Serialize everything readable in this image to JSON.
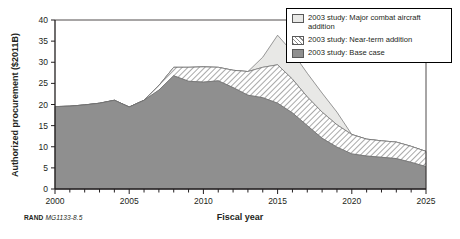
{
  "source_note": {
    "org": "RAND",
    "doc_id": "MG1133-8.5"
  },
  "legend": {
    "items": [
      {
        "label": "2003 study: Major combat aircraft addition",
        "swatch": "light-solid-swatch",
        "color": "#e8e8e6"
      },
      {
        "label": "2003 study: Near-term addition",
        "swatch": "diagonal-hatch-swatch",
        "color": "#8d8d8d"
      },
      {
        "label": "2003 study: Base case",
        "swatch": "gray-solid-swatch",
        "color": "#8f8f8f"
      }
    ]
  },
  "chart_data": {
    "type": "area",
    "title": "",
    "xlabel": "Fiscal year",
    "ylabel": "Authorized procurement ($2011B)",
    "stacked": true,
    "grid": false,
    "legend_position": "top-right",
    "xlim": [
      2000,
      2025
    ],
    "ylim": [
      0,
      40
    ],
    "xticks": [
      2000,
      2005,
      2010,
      2015,
      2020,
      2025
    ],
    "xtick_labels": [
      "2000",
      "2005",
      "2010",
      "2015",
      "2020",
      "2025"
    ],
    "yticks": [
      0,
      5,
      10,
      15,
      20,
      25,
      30,
      35,
      40
    ],
    "ytick_labels": [
      "0",
      "5",
      "10",
      "15",
      "20",
      "25",
      "30",
      "35",
      "40"
    ],
    "x": [
      2000,
      2001,
      2002,
      2003,
      2004,
      2005,
      2006,
      2007,
      2008,
      2009,
      2010,
      2011,
      2012,
      2013,
      2014,
      2015,
      2016,
      2017,
      2018,
      2019,
      2020,
      2021,
      2022,
      2023,
      2024,
      2025
    ],
    "series": [
      {
        "name": "2003 study: Base case",
        "values": [
          19.5,
          19.6,
          19.9,
          20.3,
          21.0,
          19.4,
          21.0,
          23.4,
          26.8,
          25.5,
          25.3,
          25.6,
          24.0,
          22.2,
          21.6,
          20.3,
          18.0,
          15.0,
          12.0,
          9.9,
          8.3,
          7.8,
          7.5,
          7.2,
          6.3,
          5.3
        ]
      },
      {
        "name": "2003 study: Near-term addition",
        "values": [
          0.0,
          0.0,
          0.0,
          0.0,
          0.0,
          0.0,
          0.0,
          1.1,
          2.0,
          3.3,
          3.6,
          3.2,
          4.1,
          5.6,
          7.2,
          9.1,
          8.0,
          6.8,
          6.2,
          5.3,
          4.6,
          4.0,
          3.9,
          3.9,
          3.8,
          3.6
        ]
      },
      {
        "name": "2003 study: Major combat aircraft addition",
        "values": [
          0.0,
          0.0,
          0.0,
          0.0,
          0.0,
          0.0,
          0.0,
          0.0,
          0.0,
          0.0,
          0.0,
          0.0,
          0.0,
          0.0,
          2.4,
          7.0,
          6.4,
          5.6,
          4.5,
          3.0,
          0.0,
          0.0,
          0.0,
          0.0,
          0.0,
          0.0
        ]
      }
    ],
    "totals": [
      19.5,
      19.6,
      19.9,
      20.3,
      21.0,
      19.4,
      21.0,
      24.5,
      28.8,
      28.8,
      28.9,
      28.8,
      28.1,
      27.8,
      31.2,
      36.4,
      32.4,
      27.4,
      22.7,
      18.2,
      12.9,
      11.8,
      11.4,
      11.1,
      10.1,
      8.9
    ]
  }
}
